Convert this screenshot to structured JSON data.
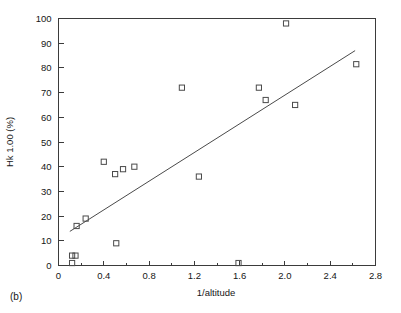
{
  "chart_data": {
    "type": "scatter",
    "title": "",
    "panel_label": "(b)",
    "xlabel": "1/altitude",
    "ylabel": "Hk 1.00 (%)",
    "xlim": [
      0,
      2.8
    ],
    "ylim": [
      0,
      100
    ],
    "xticks": [
      0,
      0.4,
      0.8,
      1.2,
      1.6,
      2.0,
      2.4,
      2.8
    ],
    "xtick_labels": [
      "0",
      "0.4",
      "0.8",
      "1.2",
      "1.6",
      "2.0",
      "2.4",
      "2.8"
    ],
    "xminor_ticks": [
      0.2,
      0.6,
      1.0,
      1.4,
      1.8,
      2.2,
      2.6
    ],
    "yticks": [
      0,
      10,
      20,
      30,
      40,
      50,
      60,
      70,
      80,
      90,
      100
    ],
    "ytick_labels": [
      "0",
      "10",
      "20",
      "30",
      "40",
      "50",
      "60",
      "70",
      "80",
      "90",
      "100"
    ],
    "grid": false,
    "legend": null,
    "marker_style": "open-square",
    "marker_color": "#4a4a4a",
    "line_color": "#4a4a4a",
    "points": [
      {
        "x": 0.12,
        "y": 1.0
      },
      {
        "x": 0.12,
        "y": 4.0
      },
      {
        "x": 0.15,
        "y": 4.0
      },
      {
        "x": 0.16,
        "y": 16.0
      },
      {
        "x": 0.24,
        "y": 19.0
      },
      {
        "x": 0.4,
        "y": 42.0
      },
      {
        "x": 0.5,
        "y": 37.0
      },
      {
        "x": 0.51,
        "y": 9.0
      },
      {
        "x": 0.57,
        "y": 39.0
      },
      {
        "x": 0.67,
        "y": 40.0
      },
      {
        "x": 1.09,
        "y": 72.0
      },
      {
        "x": 1.24,
        "y": 36.0
      },
      {
        "x": 1.59,
        "y": 1.0
      },
      {
        "x": 1.77,
        "y": 72.0
      },
      {
        "x": 1.83,
        "y": 67.0
      },
      {
        "x": 2.01,
        "y": 98.0
      },
      {
        "x": 2.09,
        "y": 65.0
      },
      {
        "x": 2.63,
        "y": 81.5
      }
    ],
    "trendline": {
      "x_start": 0.1,
      "y_start": 13.8,
      "x_end": 2.62,
      "y_end": 87.0
    }
  }
}
